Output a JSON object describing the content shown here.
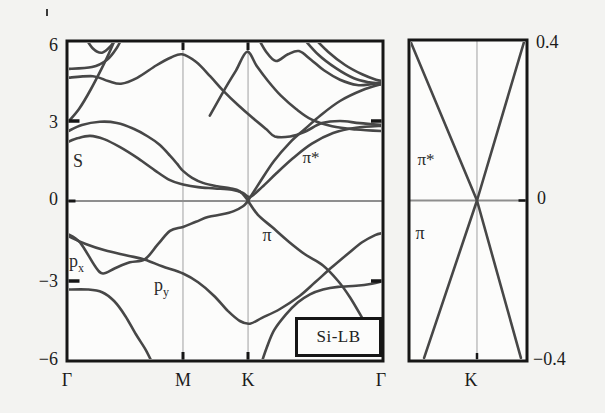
{
  "figure": {
    "bg": "#f3f3f1",
    "panel_bg": "#fcfcfb",
    "band_color": "#474747",
    "axis_color": "#161616",
    "grid_color": "#c9c9c9",
    "zero_line_color": "#8e8e8e"
  },
  "chart_data": {
    "type": "line",
    "title": "Si-LB",
    "panels": [
      {
        "name": "band-structure-main",
        "k_labels": [
          "Γ",
          "M",
          "K",
          "Γ"
        ],
        "k_fractions": [
          0,
          0.367,
          0.573,
          1
        ],
        "ylim": [
          -6,
          6
        ],
        "yticks": [
          6,
          3,
          0,
          -3,
          -6
        ],
        "ytick_labels": [
          "6",
          "3",
          "0",
          "−3",
          "−6"
        ],
        "fermi_level": 0,
        "inset_label": "Si-LB",
        "band_labels": {
          "s": "S",
          "p": "p",
          "px_sub": "x",
          "py_sub": "y",
          "pi": "π",
          "pi_star": "π*"
        },
        "series": [
          {
            "name": "pi-left",
            "points": [
              [
                0,
                -1.22
              ],
              [
                0.041,
                -1.55
              ],
              [
                0.089,
                -2.45
              ],
              [
                0.114,
                -2.72
              ],
              [
                0.152,
                -2.52
              ],
              [
                0.199,
                -2.3
              ],
              [
                0.247,
                -2.18
              ],
              [
                0.288,
                -1.62
              ],
              [
                0.326,
                -1.12
              ],
              [
                0.367,
                -0.97
              ],
              [
                0.408,
                -0.78
              ],
              [
                0.446,
                -0.6
              ],
              [
                0.491,
                -0.5
              ],
              [
                0.528,
                -0.38
              ],
              [
                0.557,
                -0.2
              ],
              [
                0.573,
                0
              ]
            ]
          },
          {
            "name": "pi-right",
            "points": [
              [
                0.573,
                0
              ],
              [
                0.604,
                -0.52
              ],
              [
                0.649,
                -0.98
              ],
              [
                0.699,
                -1.5
              ],
              [
                0.753,
                -2.0
              ],
              [
                0.81,
                -2.42
              ],
              [
                0.858,
                -3.0
              ],
              [
                0.896,
                -3.62
              ],
              [
                0.934,
                -4.38
              ],
              [
                0.96,
                -4.9
              ]
            ]
          },
          {
            "name": "p-band",
            "points": [
              [
                0,
                -1.3
              ],
              [
                0.057,
                -1.6
              ],
              [
                0.12,
                -1.85
              ],
              [
                0.193,
                -2.05
              ],
              [
                0.247,
                -2.2
              ],
              [
                0.301,
                -2.45
              ],
              [
                0.367,
                -2.72
              ],
              [
                0.415,
                -3.05
              ],
              [
                0.465,
                -3.55
              ],
              [
                0.509,
                -4.12
              ],
              [
                0.547,
                -4.5
              ],
              [
                0.579,
                -4.6
              ],
              [
                0.617,
                -4.38
              ],
              [
                0.674,
                -4.05
              ],
              [
                0.737,
                -3.55
              ],
              [
                0.785,
                -3.05
              ],
              [
                0.839,
                -2.48
              ],
              [
                0.889,
                -1.98
              ],
              [
                0.934,
                -1.55
              ],
              [
                0.975,
                -1.28
              ],
              [
                1,
                -1.2
              ]
            ]
          },
          {
            "name": "sigma-v-left",
            "points": [
              [
                0,
                -3.32
              ],
              [
                0.066,
                -3.32
              ],
              [
                0.111,
                -3.42
              ],
              [
                0.149,
                -3.75
              ],
              [
                0.184,
                -4.3
              ],
              [
                0.218,
                -5.0
              ],
              [
                0.25,
                -5.6
              ],
              [
                0.275,
                -6.2
              ]
            ]
          },
          {
            "name": "sigma-v-right",
            "points": [
              [
                0.612,
                -6.2
              ],
              [
                0.632,
                -5.5
              ],
              [
                0.655,
                -4.85
              ],
              [
                0.693,
                -4.25
              ],
              [
                0.731,
                -3.8
              ],
              [
                0.769,
                -3.5
              ],
              [
                0.81,
                -3.32
              ],
              [
                0.858,
                -3.22
              ],
              [
                0.915,
                -3.18
              ],
              [
                0.965,
                -3.1
              ],
              [
                1,
                -3.0
              ]
            ]
          },
          {
            "name": "pi-star-left",
            "points": [
              [
                0,
                2.6
              ],
              [
                0.047,
                2.85
              ],
              [
                0.104,
                2.97
              ],
              [
                0.158,
                2.93
              ],
              [
                0.209,
                2.72
              ],
              [
                0.256,
                2.42
              ],
              [
                0.294,
                2.1
              ],
              [
                0.326,
                1.7
              ],
              [
                0.348,
                1.4
              ],
              [
                0.367,
                1.13
              ],
              [
                0.396,
                0.87
              ],
              [
                0.43,
                0.68
              ],
              [
                0.475,
                0.55
              ],
              [
                0.516,
                0.48
              ],
              [
                0.547,
                0.36
              ],
              [
                0.573,
                0.02
              ]
            ]
          },
          {
            "name": "pi-star-right",
            "points": [
              [
                0.573,
                0.02
              ],
              [
                0.611,
                0.72
              ],
              [
                0.655,
                1.5
              ],
              [
                0.706,
                2.2
              ],
              [
                0.753,
                2.7
              ],
              [
                0.801,
                3.2
              ],
              [
                0.864,
                3.75
              ],
              [
                0.934,
                4.15
              ],
              [
                1,
                4.4
              ]
            ]
          },
          {
            "name": "s-band",
            "points": [
              [
                0,
                2.2
              ],
              [
                0.035,
                2.36
              ],
              [
                0.073,
                2.44
              ],
              [
                0.117,
                2.32
              ],
              [
                0.168,
                2.02
              ],
              [
                0.225,
                1.6
              ],
              [
                0.278,
                1.15
              ],
              [
                0.326,
                0.78
              ],
              [
                0.367,
                0.62
              ],
              [
                0.415,
                0.52
              ],
              [
                0.468,
                0.47
              ],
              [
                0.522,
                0.42
              ],
              [
                0.557,
                0.3
              ],
              [
                0.579,
                0.15
              ],
              [
                0.617,
                0.52
              ],
              [
                0.661,
                1.02
              ],
              [
                0.715,
                1.6
              ],
              [
                0.775,
                2.15
              ],
              [
                0.842,
                2.55
              ],
              [
                0.915,
                2.75
              ],
              [
                1,
                2.82
              ]
            ]
          },
          {
            "name": "upper-1",
            "points": [
              [
                0,
                4.95
              ],
              [
                0.079,
                5.02
              ],
              [
                0.127,
                5.3
              ],
              [
                0.158,
                5.75
              ],
              [
                0.177,
                6.2
              ]
            ]
          },
          {
            "name": "upper-2-dome",
            "points": [
              [
                0,
                4.62
              ],
              [
                0.082,
                4.68
              ],
              [
                0.13,
                4.5
              ],
              [
                0.171,
                4.4
              ],
              [
                0.222,
                4.62
              ],
              [
                0.282,
                5.08
              ],
              [
                0.329,
                5.38
              ],
              [
                0.364,
                5.5
              ],
              [
                0.408,
                5.22
              ],
              [
                0.453,
                4.68
              ],
              [
                0.497,
                4.1
              ],
              [
                0.541,
                3.6
              ],
              [
                0.589,
                3.1
              ],
              [
                0.63,
                2.7
              ],
              [
                0.658,
                2.42
              ],
              [
                0.706,
                2.42
              ],
              [
                0.753,
                2.6
              ],
              [
                0.807,
                2.92
              ],
              [
                0.864,
                3.0
              ],
              [
                0.927,
                2.92
              ],
              [
                1,
                2.85
              ]
            ]
          },
          {
            "name": "upper-3-steep",
            "points": [
              [
                0,
                2.92
              ],
              [
                0.038,
                3.45
              ],
              [
                0.076,
                4.2
              ],
              [
                0.111,
                5.0
              ],
              [
                0.139,
                5.7
              ],
              [
                0.156,
                6.2
              ]
            ]
          },
          {
            "name": "upper-4-dip",
            "points": [
              [
                0.054,
                6.2
              ],
              [
                0.082,
                5.72
              ],
              [
                0.111,
                5.56
              ],
              [
                0.139,
                5.82
              ],
              [
                0.16,
                6.2
              ]
            ]
          },
          {
            "name": "upper-5-k-peak",
            "points": [
              [
                0.452,
                3.2
              ],
              [
                0.497,
                4.15
              ],
              [
                0.535,
                4.9
              ],
              [
                0.57,
                5.6
              ],
              [
                0.601,
                5.05
              ],
              [
                0.636,
                4.5
              ],
              [
                0.677,
                3.95
              ],
              [
                0.725,
                3.45
              ],
              [
                0.775,
                3.05
              ],
              [
                0.839,
                2.8
              ],
              [
                0.915,
                2.68
              ],
              [
                1,
                2.62
              ]
            ]
          },
          {
            "name": "upper-6-wave",
            "points": [
              [
                0.601,
                6.2
              ],
              [
                0.63,
                5.6
              ],
              [
                0.661,
                5.25
              ],
              [
                0.699,
                5.5
              ],
              [
                0.734,
                5.62
              ],
              [
                0.772,
                5.3
              ],
              [
                0.813,
                4.9
              ],
              [
                0.864,
                4.55
              ],
              [
                0.918,
                4.35
              ],
              [
                0.962,
                4.38
              ],
              [
                1,
                4.45
              ]
            ]
          },
          {
            "name": "upper-7",
            "points": [
              [
                0.741,
                6.2
              ],
              [
                0.794,
                5.5
              ],
              [
                0.851,
                4.98
              ],
              [
                0.908,
                4.6
              ],
              [
                0.956,
                4.45
              ],
              [
                1,
                4.4
              ]
            ]
          },
          {
            "name": "upper-8",
            "points": [
              [
                0.775,
                6.2
              ],
              [
                0.826,
                5.6
              ],
              [
                0.88,
                5.1
              ],
              [
                0.934,
                4.75
              ],
              [
                0.978,
                4.55
              ],
              [
                1,
                4.5
              ]
            ]
          }
        ]
      },
      {
        "name": "dirac-cone-zoom",
        "k_labels": [
          "K"
        ],
        "k_fractions": [
          0.576
        ],
        "ylim": [
          -0.4,
          0.4
        ],
        "yticks": [
          0.4,
          0,
          -0.4
        ],
        "ytick_labels": [
          "0.4",
          "0",
          "−0.4"
        ],
        "fermi_level": 0,
        "band_labels": {
          "pi": "π",
          "pi_star": "π*"
        },
        "series": [
          {
            "name": "pi-star",
            "straight": true,
            "points": [
              [
                0.01,
                0.398
              ],
              [
                0.576,
                0
              ],
              [
                0.978,
                0.398
              ]
            ]
          },
          {
            "name": "pi",
            "straight": true,
            "points": [
              [
                0.128,
                -0.392
              ],
              [
                0.576,
                0
              ],
              [
                0.948,
                -0.392
              ]
            ]
          }
        ]
      }
    ]
  }
}
